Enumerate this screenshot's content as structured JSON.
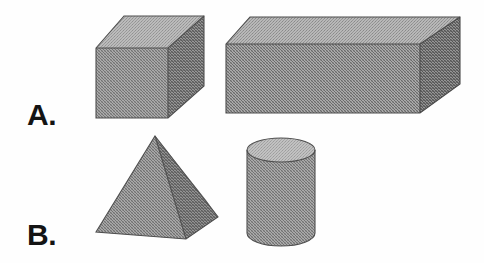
{
  "figure": {
    "kind": "geometry-solids-worksheet",
    "background_color": "#fefefe",
    "width": 484,
    "height": 263
  },
  "labels": [
    {
      "id": "a",
      "text": "A."
    },
    {
      "id": "b",
      "text": "B."
    }
  ],
  "rows": [
    {
      "label": "A.",
      "shapes": [
        {
          "name": "cube",
          "display_name": "Cube"
        },
        {
          "name": "rectangular-prism",
          "display_name": "Rectangular prism"
        }
      ]
    },
    {
      "label": "B.",
      "shapes": [
        {
          "name": "square-pyramid",
          "display_name": "Square pyramid"
        },
        {
          "name": "cylinder",
          "display_name": "Cylinder"
        }
      ]
    }
  ],
  "palette": {
    "top_face": "#9a9a9a",
    "front_face": "#868686",
    "side_face": "#6f6f6f",
    "pyramid_left_face": "#838383",
    "pyramid_right_face": "#6d6d6d",
    "cylinder_top": "#a8a8a8",
    "cylinder_body": "#858585",
    "outline": "#4a4a4a",
    "label_color": "#141414",
    "background": "#fefefe"
  }
}
